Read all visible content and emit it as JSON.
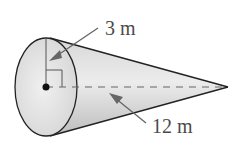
{
  "figure": {
    "type": "right-circular-cone",
    "labels": {
      "radius": "3 m",
      "height": "12 m"
    },
    "colors": {
      "stroke": "#222222",
      "fill_light": "#eaeaea",
      "fill_dark": "#c4c4c4",
      "arrow": "#666666",
      "text": "#4a4a4a"
    }
  }
}
